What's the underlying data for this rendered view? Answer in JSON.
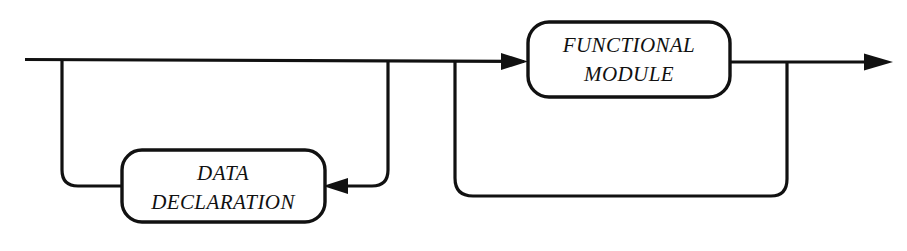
{
  "diagram": {
    "type": "railroad-syntax-diagram",
    "title": "",
    "line_color": "#111111",
    "background_color": "#ffffff",
    "nodes": [
      {
        "id": "functional-module",
        "label_lines": [
          "FUNCTIONAL",
          "MODULE"
        ],
        "label_line1": "FUNCTIONAL",
        "label_line2": "MODULE",
        "shape": "rounded-rectangle",
        "x": 528,
        "y": 22,
        "width": 202,
        "height": 75
      },
      {
        "id": "data-declaration",
        "label_lines": [
          "DATA",
          "DECLARATION"
        ],
        "label_line1": "DATA",
        "label_line2": "DECLARATION",
        "shape": "rounded-rectangle",
        "x": 122,
        "y": 150,
        "width": 203,
        "height": 72
      }
    ],
    "connectors": [
      {
        "id": "main-rail",
        "description": "horizontal entry rail",
        "from_x": 25,
        "to_x": 528,
        "y": 60
      },
      {
        "id": "data-declaration-loop",
        "description": "optional repeat loop into DATA DECLARATION",
        "arrow_direction": "left"
      },
      {
        "id": "functional-module-loop",
        "description": "repeat loop back to FUNCTIONAL MODULE",
        "arrow_direction": "right"
      },
      {
        "id": "exit-rail",
        "description": "exit rail with terminating arrow",
        "from_x": 730,
        "to_x": 890,
        "y": 62,
        "arrow_direction": "right"
      }
    ]
  }
}
